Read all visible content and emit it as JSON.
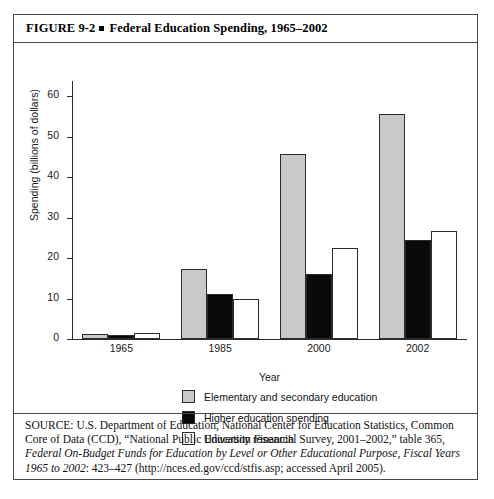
{
  "figure": {
    "number": "FIGURE 9-2",
    "separator": "square-bullet",
    "title": "Federal Education Spending, 1965–2002"
  },
  "chart_data": {
    "type": "bar",
    "title": "Federal Education Spending, 1965–2002",
    "xlabel": "Year",
    "ylabel": "Spending (billions of dollars)",
    "categories": [
      "1965",
      "1985",
      "2000",
      "2002"
    ],
    "ylim": [
      0,
      62
    ],
    "yticks": [
      0,
      10,
      20,
      30,
      40,
      50,
      60
    ],
    "ytick_labels": [
      "0",
      "10",
      "20",
      "30",
      "40",
      "50",
      "60"
    ],
    "grid": false,
    "legend_position": "bottom-center",
    "series": [
      {
        "name": "Elementary and secondary education",
        "color": "#c9c9c9",
        "values": [
          1.2,
          17.4,
          45.8,
          55.5
        ]
      },
      {
        "name": "Higher education spending",
        "color": "#0a0a0a",
        "values": [
          1.0,
          11.2,
          16.0,
          24.4
        ]
      },
      {
        "name": "University research",
        "color": "#ffffff",
        "values": [
          1.5,
          9.8,
          22.6,
          26.8
        ]
      }
    ]
  },
  "legend": {
    "items": [
      {
        "label": "Elementary and secondary education",
        "swatch": "gray-swatch"
      },
      {
        "label": "Higher education spending",
        "swatch": "black-swatch"
      },
      {
        "label": "University research",
        "swatch": "white-swatch"
      }
    ]
  },
  "source": {
    "part1": "SOURCE: U.S. Department of Education, National Center for Education Statistics, Common Core of Data (CCD), “National Public Education Financial Survey, 2001–2002,” table 365, ",
    "italic1": "Federal On-Budget Funds for Education by Level or Other Educational Purpose, Fiscal Years 1965 to 2002",
    "part2": ": 423–427 (http://nces.ed.gov/ccd/stfis.asp; accessed April 2005)."
  }
}
